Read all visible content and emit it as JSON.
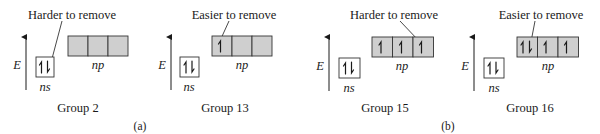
{
  "figure": {
    "colors": {
      "filled_orbital": "#cfcfcf",
      "empty_ns_box": "#ffffff",
      "line": "#1a1a1a"
    },
    "axis_label": "E",
    "ns_label": "ns",
    "np_label": "np",
    "part_labels": {
      "a": "(a)",
      "b": "(b)"
    },
    "panels": [
      {
        "group": "Group 2",
        "annotation": "Harder to remove",
        "ns_electrons": "paired",
        "np_electrons": [
          "",
          "",
          ""
        ],
        "annotation_target": "ns electron"
      },
      {
        "group": "Group 13",
        "annotation": "Easier to remove",
        "ns_electrons": "paired",
        "np_electrons": [
          "up",
          "",
          ""
        ],
        "annotation_target": "np electron 1"
      },
      {
        "group": "Group 15",
        "annotation": "Harder to remove",
        "ns_electrons": "paired",
        "np_electrons": [
          "up",
          "up",
          "up"
        ],
        "annotation_target": "np electron 3"
      },
      {
        "group": "Group 16",
        "annotation": "Easier to remove",
        "ns_electrons": "paired",
        "np_electrons": [
          "paired",
          "up",
          "up"
        ],
        "annotation_target": "np electron 1 (paired)"
      }
    ]
  }
}
